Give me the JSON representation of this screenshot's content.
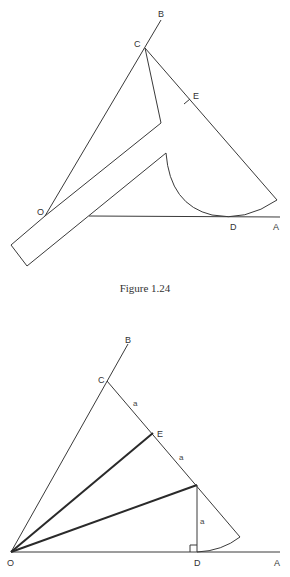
{
  "figure_top": {
    "caption": "Figure 1.24",
    "labels": {
      "B": "B",
      "C": "C",
      "E": "E",
      "O": "O",
      "D": "D",
      "A": "A"
    }
  },
  "figure_bottom": {
    "labels": {
      "B": "B",
      "C": "C",
      "E": "E",
      "O": "O",
      "D": "D",
      "A": "A",
      "seg_CE": "a",
      "seg_E_F": "a",
      "seg_FD": "a"
    }
  },
  "colors": {
    "line": "#3a3a3a",
    "text": "#333333",
    "background": "#ffffff"
  }
}
